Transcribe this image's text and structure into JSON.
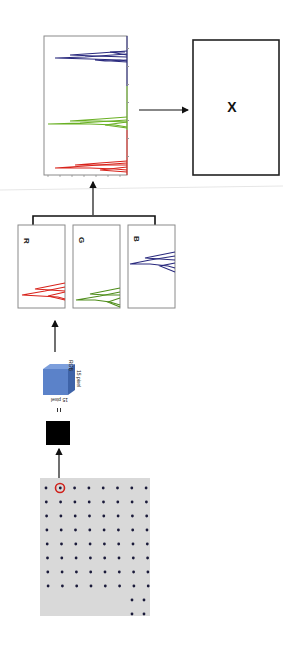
{
  "diagram": {
    "orientation": "rotated-90-clockwise",
    "stages": [
      {
        "id": "image-grid",
        "description": "Grid of dots on gray background, one dot circled in red"
      },
      {
        "id": "pixel-patch",
        "description": "Black square patch"
      },
      {
        "id": "equals",
        "label": "="
      },
      {
        "id": "rgb-cube",
        "top_label": "RGB",
        "side_label": "15 pixel",
        "bottom_label": "15 pixel"
      },
      {
        "id": "channel-histograms",
        "labels": [
          "R",
          "G",
          "B"
        ]
      },
      {
        "id": "concatenated-histogram",
        "description": "Concatenated R, G, B histograms"
      },
      {
        "id": "output-box",
        "label": "X"
      }
    ],
    "colors": {
      "red": "#d8231b",
      "green": "#69b023",
      "blue": "#2a2a7e",
      "cube": "#5b82c9",
      "grid_bg": "#d9d9d9",
      "circle": "#d0211b"
    },
    "grid": {
      "full_rows": 8,
      "dots_per_row": 8,
      "partial_rows": 2,
      "dots_in_partial_row": 2
    }
  },
  "chart_data": [
    {
      "type": "line",
      "title": "R",
      "series": [
        {
          "name": "R",
          "color": "#d8231b"
        }
      ]
    },
    {
      "type": "line",
      "title": "G",
      "series": [
        {
          "name": "G",
          "color": "#69b023"
        }
      ]
    },
    {
      "type": "line",
      "title": "B",
      "series": [
        {
          "name": "B",
          "color": "#2a2a7e"
        }
      ]
    },
    {
      "type": "line",
      "title": "",
      "series": [
        {
          "name": "R",
          "color": "#d8231b"
        },
        {
          "name": "G",
          "color": "#69b023"
        },
        {
          "name": "B",
          "color": "#2a2a7e"
        }
      ]
    }
  ],
  "labels": {
    "r": "R",
    "g": "G",
    "b": "B",
    "x": "X",
    "equals": "=",
    "cube_top": "RGB",
    "cube_side": "15 pixel",
    "cube_bottom": "15 pixel"
  }
}
